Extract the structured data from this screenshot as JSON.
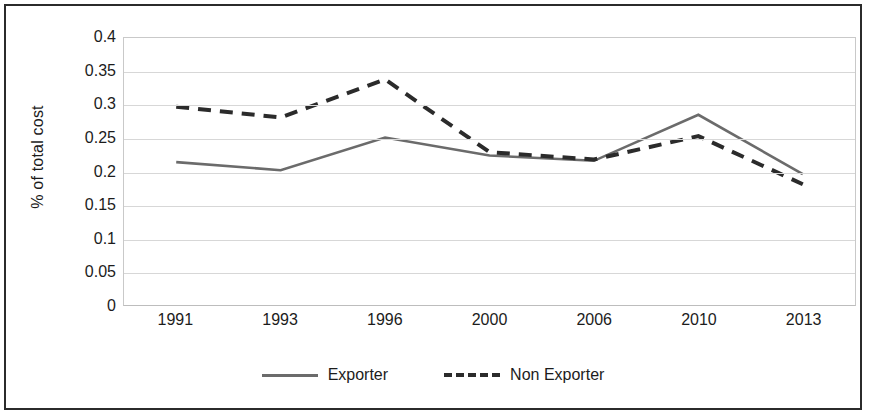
{
  "chart_data": {
    "type": "line",
    "title": "",
    "xlabel": "",
    "ylabel": "% of total cost",
    "categories": [
      "1991",
      "1993",
      "1996",
      "2000",
      "2006",
      "2010",
      "2013"
    ],
    "ylim": [
      0,
      0.4
    ],
    "yticks": [
      "0",
      "0.05",
      "0.1",
      "0.15",
      "0.2",
      "0.25",
      "0.3",
      "0.35",
      "0.4"
    ],
    "ytick_values": [
      0,
      0.05,
      0.1,
      0.15,
      0.2,
      0.25,
      0.3,
      0.35,
      0.4
    ],
    "grid": true,
    "legend_position": "bottom",
    "series": [
      {
        "name": "Exporter",
        "style": "solid",
        "color": "#6b6b6b",
        "values": [
          0.214,
          0.202,
          0.251,
          0.224,
          0.216,
          0.285,
          0.196
        ]
      },
      {
        "name": "Non Exporter",
        "style": "dashed",
        "color": "#2b2b2b",
        "values": [
          0.297,
          0.281,
          0.338,
          0.229,
          0.218,
          0.253,
          0.181
        ]
      }
    ]
  },
  "legend": {
    "items": [
      {
        "label": "Exporter",
        "style": "solid"
      },
      {
        "label": "Non Exporter",
        "style": "dashed"
      }
    ]
  }
}
